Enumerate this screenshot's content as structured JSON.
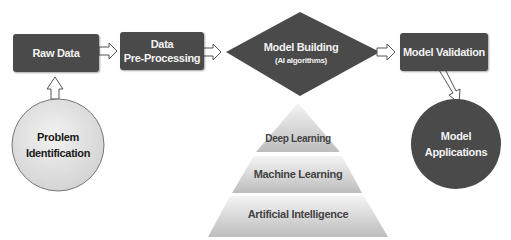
{
  "diagram": {
    "nodes": {
      "raw_data": "Raw Data",
      "pre_processing_line1": "Data",
      "pre_processing_line2": "Pre-Processing",
      "model_building": "Model Building",
      "model_building_sub": "(AI algorithms)",
      "model_validation": "Model Validation",
      "problem_line1": "Problem",
      "problem_line2": "Identification",
      "applications_line1": "Model",
      "applications_line2": "Applications"
    },
    "pyramid": [
      "Deep Learning",
      "Machine Learning",
      "Artificial Intelligence"
    ],
    "colors": {
      "dark_node": "#4a4a4a",
      "light_node": "#dcdcdc",
      "text_light": "#f2f2f2",
      "text_dark": "#1a1a1a",
      "pyramid_text": "#444444"
    }
  }
}
